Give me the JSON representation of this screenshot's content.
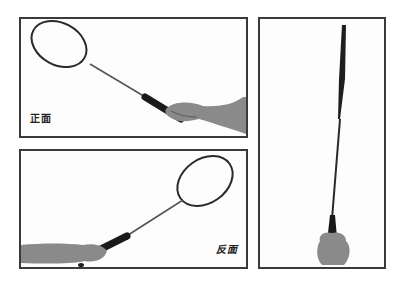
{
  "figure": {
    "panels": [
      {
        "id": "front",
        "caption": "正面",
        "description": "Racket held with forehand grip, head upper-left"
      },
      {
        "id": "back",
        "caption": "反面",
        "description": "Racket held from the left, head upper-right"
      },
      {
        "id": "side",
        "caption": "",
        "description": "Racket viewed edge-on, held vertically"
      }
    ],
    "colors": {
      "frame_border": "#3a3a3a",
      "racket": "#2a2a2a",
      "grip": "#1a1a1a",
      "skin": "#8a8a8a",
      "background": "#ffffff"
    }
  }
}
